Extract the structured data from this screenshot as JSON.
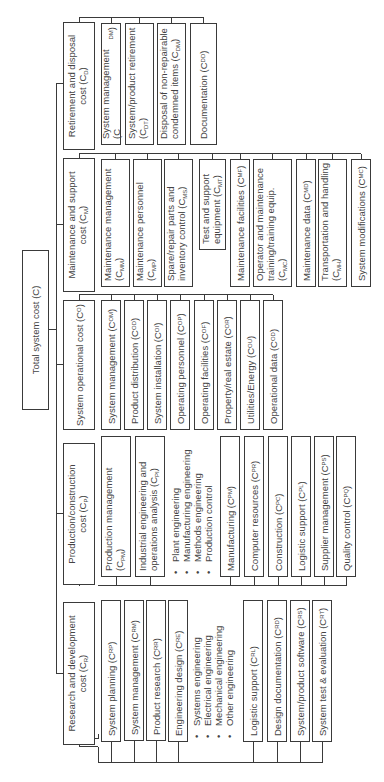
{
  "root": {
    "label": "Total system cost (C)"
  },
  "categories": [
    {
      "label": "Research and development",
      "label2": "cost (C",
      "sub": "R",
      "children": [
        {
          "label": "System planning (C",
          "sub": "RP"
        },
        {
          "label": "System management (C",
          "sub": "RM"
        },
        {
          "label": "Product research (C",
          "sub": "RR"
        },
        {
          "label": "Engineering design (C",
          "sub": "RE"
        },
        {
          "label": "Logistic support (C",
          "sub": "RL"
        },
        {
          "label": "Design documentation (C",
          "sub": "RD"
        },
        {
          "label": "System/product software (C",
          "sub": "RS"
        },
        {
          "label": "System test & evaluation (C",
          "sub": "RT"
        }
      ],
      "bullets": [
        "Systems engineering",
        "Electrical engineering",
        "Mechanical engineering",
        "Other engineering"
      ]
    },
    {
      "label": "Production/construction",
      "label2": "cost (C",
      "sub": "P",
      "children": [
        {
          "label": "Production management",
          "label2": "(C",
          "sub": "PM"
        },
        {
          "label": "Industrial engineering and",
          "label2": "operations analysis (C",
          "sub": "PI"
        },
        {
          "label": "Manufacturing (C",
          "sub": "PM"
        },
        {
          "label": "Computer resources (C",
          "sub": "PR"
        },
        {
          "label": "Construction (C",
          "sub": "PC"
        },
        {
          "label": "Logistic support (C",
          "sub": "PL"
        },
        {
          "label": "Supplier management (C",
          "sub": "PS"
        },
        {
          "label": "Quality control (C",
          "sub": "PQ"
        }
      ],
      "bullets": [
        "Plant engineering",
        "Manufacturing engineering",
        "Methods engineering",
        "Production control"
      ]
    },
    {
      "label": "System operational cost (C",
      "sub": "O",
      "children": [
        {
          "label": "System management (C",
          "sub": "OM"
        },
        {
          "label": "Product distribution (C",
          "sub": "OD"
        },
        {
          "label": "System installation (C",
          "sub": "OI"
        },
        {
          "label": "Operating personnel (C",
          "sub": "OP"
        },
        {
          "label": "Operating facilities (C",
          "sub": "OF"
        },
        {
          "label": "Property/real estate (C",
          "sub": "OR"
        },
        {
          "label": "Utilities/Energy (C",
          "sub": "OU"
        },
        {
          "label": "Operational data (C",
          "sub": "OD"
        }
      ]
    },
    {
      "label": "Maintenance and support",
      "label2": "cost (C",
      "sub": "M",
      "children": [
        {
          "label": "Maintenance management",
          "label2": "(C",
          "sub": "MM"
        },
        {
          "label": "Maintenance personnel",
          "label2": "(C",
          "sub": "MP"
        },
        {
          "label": "Spare/repair parts and",
          "label2": "inventory control (C",
          "sub": "MS"
        },
        {
          "label": "Test and support",
          "label2": "equipment (C",
          "sub": "MT"
        },
        {
          "label": "Maintenance facilities (C",
          "sub": "MF"
        },
        {
          "label": "Operator and maintenance",
          "label2": "training/training equip.",
          "label3": "(C",
          "sub": "MC"
        },
        {
          "label": "Maintenance data (C",
          "sub": "MD"
        },
        {
          "label": "Transportation and handling",
          "label2": "(C",
          "sub": "MH"
        },
        {
          "label": "System modifications (C",
          "sub": "MC"
        }
      ]
    },
    {
      "label": "Retirement and disposal",
      "label2": "cost (C",
      "sub": "D",
      "children": [
        {
          "label": "System management (C",
          "sub": "DM"
        },
        {
          "label": "System/product retirement",
          "label2": "(C",
          "sub": "DT"
        },
        {
          "label": "Disposal of non-repairable",
          "label2": "condemned items (C",
          "sub": "DM"
        },
        {
          "label": "Documentation (C",
          "sub": "DD"
        }
      ]
    }
  ]
}
